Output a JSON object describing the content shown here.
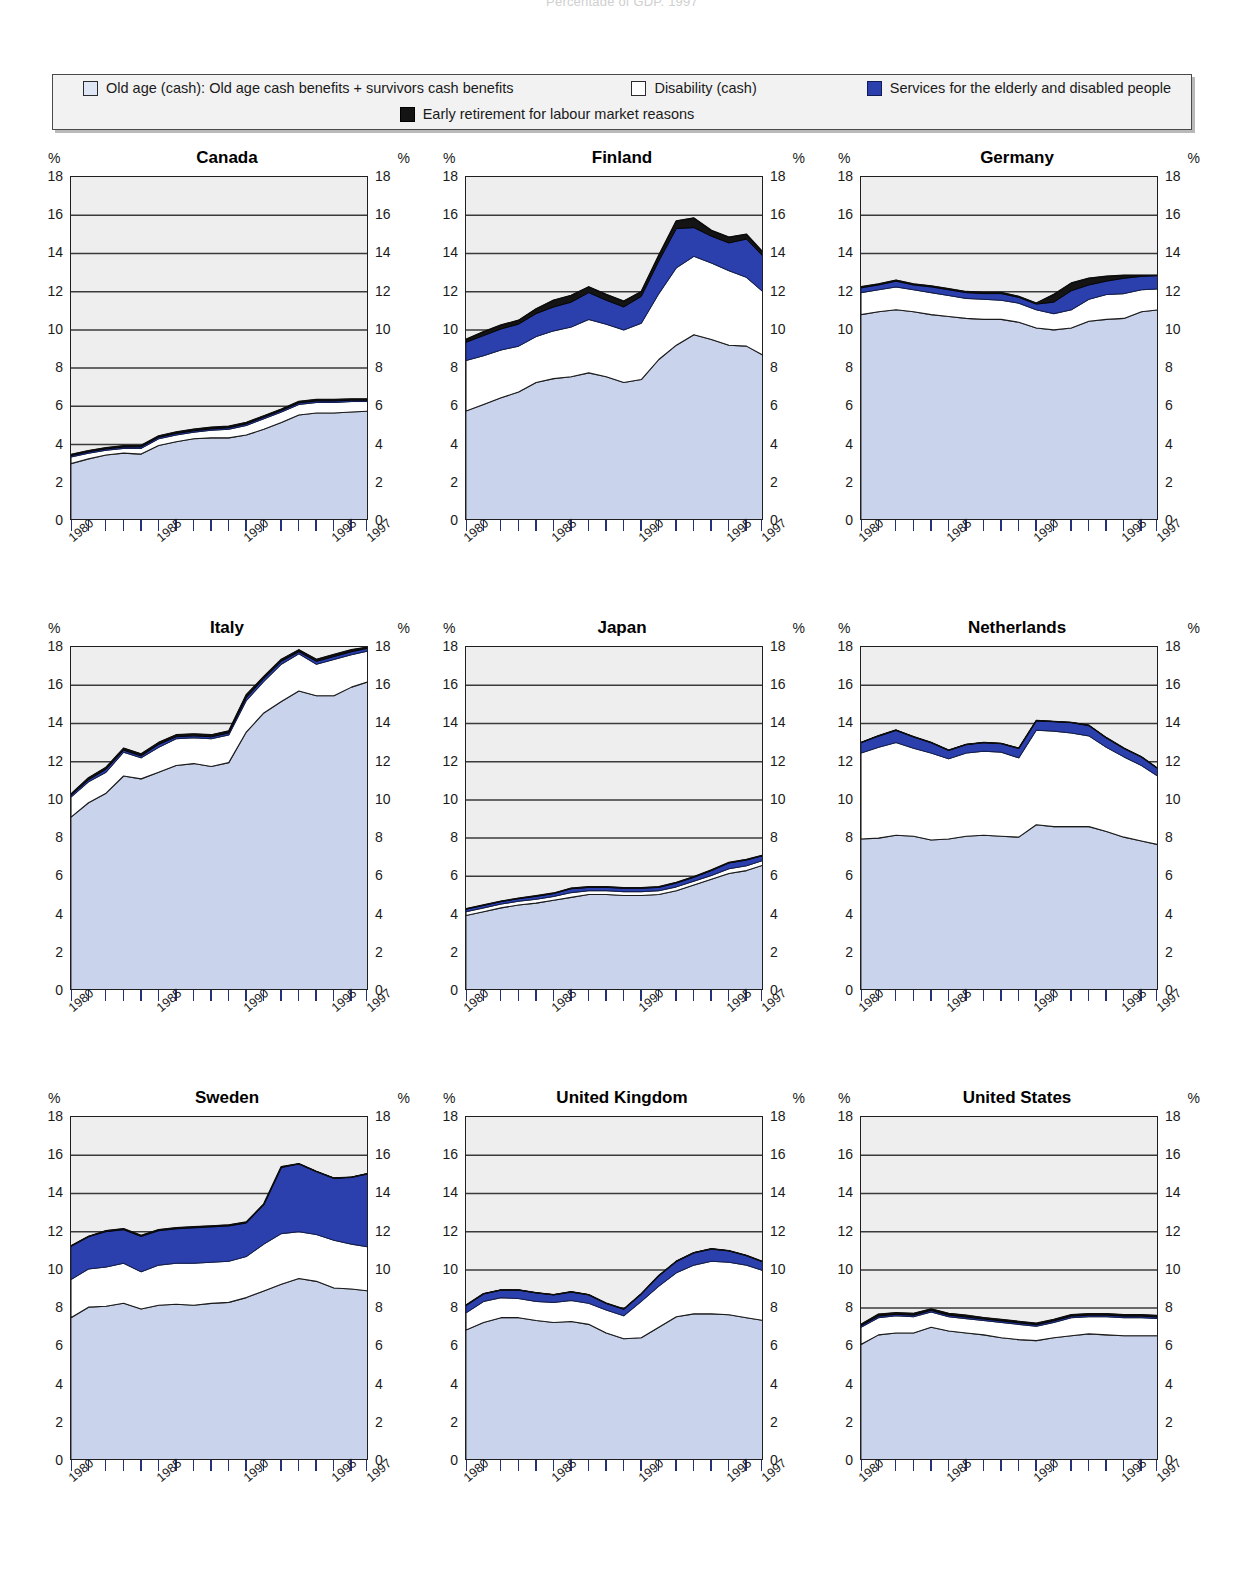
{
  "supertitle": "Percentage of GDP, 1997",
  "legend": {
    "items": [
      {
        "key": "old_age",
        "label": "Old age (cash): Old age cash benefits + survivors cash benefits",
        "color": "#dfe6f5",
        "swatch": "old-age-swatch"
      },
      {
        "key": "disability",
        "label": "Disability (cash)",
        "color": "#ffffff",
        "swatch": "disability-swatch"
      },
      {
        "key": "services",
        "label": "Services for the elderly and disabled people",
        "color": "#2b40ad",
        "swatch": "services-swatch"
      },
      {
        "key": "early_retirement",
        "label": "Early retirement for labour market reasons",
        "color": "#141414",
        "swatch": "early-retirement-swatch"
      }
    ]
  },
  "axis": {
    "unit": "%",
    "y_ticks": [
      0,
      2,
      4,
      6,
      8,
      10,
      12,
      14,
      16,
      18
    ],
    "ylim": [
      0,
      18
    ],
    "x_labels": [
      "1980",
      "1985",
      "1990",
      "1995",
      "1997"
    ],
    "x_label_years": [
      1980,
      1985,
      1990,
      1995,
      1997
    ],
    "xlim": [
      1980,
      1997
    ]
  },
  "colors": {
    "old_age": "#c9d4ec",
    "disability": "#ffffff",
    "services": "#2b40ad",
    "early_retirement": "#141414",
    "plot_background": "#eeeeee",
    "grid": "#3a3a3a",
    "frame": "#1f1f1f"
  },
  "chart_data": {
    "type": "area",
    "subtitle": "Percentage of GDP, 1997",
    "xlabel": "",
    "ylabel": "%",
    "ylim": [
      0,
      18
    ],
    "grid": true,
    "legend_position": "top",
    "stacked": true,
    "x": [
      1980,
      1981,
      1982,
      1983,
      1984,
      1985,
      1986,
      1987,
      1988,
      1989,
      1990,
      1991,
      1992,
      1993,
      1994,
      1995,
      1996,
      1997
    ],
    "series_order": [
      "old_age",
      "disability",
      "services",
      "early_retirement"
    ],
    "series_labels": {
      "old_age": "Old age (cash): Old age cash benefits + survivors cash benefits",
      "disability": "Disability (cash)",
      "services": "Services for the elderly and disabled people",
      "early_retirement": "Early retirement for labour market reasons"
    },
    "panels": [
      {
        "country": "Canada",
        "cum_old_age": [
          3.0,
          3.25,
          3.45,
          3.55,
          3.5,
          3.95,
          4.15,
          4.3,
          4.35,
          4.35,
          4.5,
          4.8,
          5.15,
          5.55,
          5.65,
          5.65,
          5.7,
          5.75
        ],
        "cum_disability": [
          3.35,
          3.55,
          3.7,
          3.8,
          3.8,
          4.3,
          4.5,
          4.65,
          4.75,
          4.8,
          5.0,
          5.35,
          5.7,
          6.1,
          6.2,
          6.2,
          6.25,
          6.25
        ],
        "cum_services": [
          3.42,
          3.62,
          3.77,
          3.87,
          3.88,
          4.38,
          4.58,
          4.72,
          4.82,
          4.88,
          5.08,
          5.43,
          5.78,
          6.18,
          6.28,
          6.28,
          6.32,
          6.32
        ],
        "cum_total": [
          3.48,
          3.68,
          3.83,
          3.93,
          3.95,
          4.45,
          4.65,
          4.8,
          4.9,
          4.95,
          5.15,
          5.5,
          5.85,
          6.25,
          6.35,
          6.35,
          6.38,
          6.38
        ]
      },
      {
        "country": "Finland",
        "cum_old_age": [
          5.75,
          6.1,
          6.45,
          6.75,
          7.25,
          7.45,
          7.55,
          7.75,
          7.55,
          7.25,
          7.4,
          8.45,
          9.2,
          9.75,
          9.5,
          9.2,
          9.15,
          8.65
        ],
        "cum_disability": [
          8.4,
          8.65,
          8.95,
          9.15,
          9.65,
          9.95,
          10.15,
          10.55,
          10.3,
          10.0,
          10.35,
          11.9,
          13.25,
          13.85,
          13.5,
          13.1,
          12.75,
          11.95
        ],
        "cum_services": [
          9.35,
          9.7,
          10.05,
          10.3,
          10.85,
          11.2,
          11.45,
          11.95,
          11.55,
          11.2,
          11.75,
          13.6,
          15.3,
          15.35,
          14.9,
          14.55,
          14.75,
          13.8
        ],
        "cum_total": [
          9.5,
          9.9,
          10.25,
          10.5,
          11.1,
          11.55,
          11.8,
          12.25,
          11.85,
          11.5,
          12.0,
          13.9,
          15.7,
          15.85,
          15.2,
          14.85,
          15.0,
          14.0
        ]
      },
      {
        "country": "Germany",
        "cum_old_age": [
          10.8,
          10.95,
          11.05,
          10.95,
          10.8,
          10.7,
          10.6,
          10.55,
          10.55,
          10.4,
          10.1,
          10.0,
          10.1,
          10.45,
          10.55,
          10.6,
          10.95,
          11.05
        ],
        "cum_disability": [
          11.95,
          12.1,
          12.25,
          12.1,
          11.95,
          11.8,
          11.65,
          11.6,
          11.55,
          11.4,
          11.05,
          10.85,
          11.05,
          11.6,
          11.85,
          11.9,
          12.1,
          12.15
        ],
        "cum_services": [
          12.2,
          12.35,
          12.55,
          12.35,
          12.25,
          12.1,
          11.95,
          11.9,
          11.9,
          11.7,
          11.35,
          11.45,
          12.05,
          12.35,
          12.55,
          12.7,
          12.8,
          12.85
        ],
        "cum_total": [
          12.25,
          12.4,
          12.6,
          12.4,
          12.3,
          12.15,
          12.0,
          11.95,
          11.95,
          11.75,
          11.4,
          11.85,
          12.45,
          12.7,
          12.8,
          12.85,
          12.85,
          12.85
        ]
      },
      {
        "country": "Italy",
        "cum_old_age": [
          9.1,
          9.85,
          10.35,
          11.25,
          11.1,
          11.45,
          11.8,
          11.9,
          11.75,
          11.95,
          13.55,
          14.55,
          15.15,
          15.7,
          15.45,
          15.45,
          15.9,
          16.2
        ],
        "cum_disability": [
          10.15,
          10.95,
          11.45,
          12.5,
          12.2,
          12.75,
          13.2,
          13.25,
          13.2,
          13.4,
          15.2,
          16.2,
          17.1,
          17.65,
          17.1,
          17.35,
          17.6,
          17.8
        ],
        "cum_services": [
          10.25,
          11.05,
          11.6,
          12.6,
          12.3,
          12.9,
          13.3,
          13.35,
          13.3,
          13.5,
          15.35,
          16.35,
          17.25,
          17.75,
          17.25,
          17.5,
          17.75,
          17.95
        ],
        "cum_total": [
          10.3,
          11.15,
          11.7,
          12.7,
          12.4,
          13.0,
          13.4,
          13.45,
          13.4,
          13.6,
          15.5,
          16.45,
          17.35,
          17.85,
          17.35,
          17.6,
          17.85,
          18.0
        ]
      },
      {
        "country": "Japan",
        "cum_old_age": [
          3.95,
          4.15,
          4.35,
          4.5,
          4.6,
          4.75,
          4.9,
          5.05,
          5.05,
          5.0,
          5.0,
          5.05,
          5.25,
          5.55,
          5.85,
          6.15,
          6.3,
          6.6
        ],
        "cum_disability": [
          4.15,
          4.35,
          4.55,
          4.7,
          4.8,
          4.95,
          5.15,
          5.25,
          5.25,
          5.2,
          5.2,
          5.25,
          5.45,
          5.75,
          6.05,
          6.4,
          6.55,
          6.85
        ],
        "cum_services": [
          4.28,
          4.48,
          4.68,
          4.83,
          4.95,
          5.1,
          5.35,
          5.42,
          5.42,
          5.38,
          5.38,
          5.42,
          5.65,
          5.95,
          6.3,
          6.7,
          6.85,
          7.1
        ],
        "cum_total": [
          4.3,
          4.5,
          4.7,
          4.85,
          4.98,
          5.12,
          5.38,
          5.45,
          5.45,
          5.4,
          5.4,
          5.45,
          5.68,
          5.98,
          6.33,
          6.72,
          6.88,
          7.12
        ]
      },
      {
        "country": "Netherlands",
        "cum_old_age": [
          7.95,
          8.0,
          8.15,
          8.1,
          7.9,
          7.95,
          8.1,
          8.15,
          8.1,
          8.05,
          8.7,
          8.6,
          8.6,
          8.6,
          8.35,
          8.05,
          7.85,
          7.65
        ],
        "cum_disability": [
          12.45,
          12.75,
          13.0,
          12.7,
          12.45,
          12.15,
          12.45,
          12.55,
          12.5,
          12.2,
          13.65,
          13.6,
          13.5,
          13.35,
          12.75,
          12.25,
          11.8,
          11.2
        ],
        "cum_services": [
          13.0,
          13.35,
          13.65,
          13.3,
          13.0,
          12.6,
          12.9,
          13.0,
          12.95,
          12.7,
          14.15,
          14.1,
          14.05,
          13.9,
          13.25,
          12.7,
          12.25,
          11.6
        ],
        "cum_total": [
          13.0,
          13.35,
          13.65,
          13.3,
          13.0,
          12.6,
          12.9,
          13.0,
          12.95,
          12.7,
          14.15,
          14.1,
          14.05,
          13.9,
          13.25,
          12.7,
          12.25,
          11.6
        ]
      },
      {
        "country": "Sweden",
        "cum_old_age": [
          7.5,
          8.05,
          8.1,
          8.25,
          7.95,
          8.15,
          8.2,
          8.15,
          8.25,
          8.3,
          8.55,
          8.9,
          9.25,
          9.55,
          9.4,
          9.05,
          9.0,
          8.9
        ],
        "cum_disability": [
          9.5,
          10.05,
          10.15,
          10.35,
          9.9,
          10.25,
          10.35,
          10.35,
          10.4,
          10.45,
          10.7,
          11.35,
          11.9,
          12.0,
          11.85,
          11.55,
          11.35,
          11.2
        ],
        "cum_services": [
          11.25,
          11.75,
          12.0,
          12.1,
          11.75,
          12.05,
          12.15,
          12.2,
          12.25,
          12.3,
          12.45,
          13.4,
          15.35,
          15.55,
          15.15,
          14.8,
          14.85,
          15.05
        ],
        "cum_total": [
          11.25,
          11.75,
          12.05,
          12.15,
          11.8,
          12.1,
          12.2,
          12.25,
          12.3,
          12.35,
          12.5,
          13.45,
          15.4,
          15.55,
          15.15,
          14.8,
          14.85,
          15.05
        ]
      },
      {
        "country": "United Kingdom",
        "cum_old_age": [
          6.85,
          7.25,
          7.5,
          7.5,
          7.35,
          7.25,
          7.3,
          7.15,
          6.7,
          6.4,
          6.45,
          7.0,
          7.55,
          7.7,
          7.7,
          7.65,
          7.5,
          7.35
        ],
        "cum_disability": [
          7.75,
          8.35,
          8.55,
          8.5,
          8.35,
          8.3,
          8.4,
          8.25,
          7.9,
          7.6,
          8.35,
          9.15,
          9.85,
          10.25,
          10.45,
          10.4,
          10.25,
          9.95
        ],
        "cum_services": [
          8.15,
          8.75,
          8.95,
          8.95,
          8.8,
          8.7,
          8.85,
          8.7,
          8.25,
          7.95,
          8.75,
          9.7,
          10.45,
          10.9,
          11.1,
          11.0,
          10.75,
          10.4
        ],
        "cum_total": [
          8.15,
          8.75,
          8.95,
          8.95,
          8.8,
          8.7,
          8.85,
          8.7,
          8.25,
          7.95,
          8.75,
          9.7,
          10.45,
          10.9,
          11.1,
          11.0,
          10.75,
          10.4
        ]
      },
      {
        "country": "United States",
        "cum_old_age": [
          6.1,
          6.6,
          6.7,
          6.7,
          7.0,
          6.8,
          6.7,
          6.6,
          6.45,
          6.35,
          6.3,
          6.45,
          6.55,
          6.65,
          6.6,
          6.55,
          6.55,
          6.55
        ],
        "cum_disability": [
          7.0,
          7.5,
          7.6,
          7.55,
          7.8,
          7.55,
          7.45,
          7.35,
          7.25,
          7.15,
          7.05,
          7.25,
          7.5,
          7.55,
          7.55,
          7.5,
          7.5,
          7.45
        ],
        "cum_services": [
          7.08,
          7.58,
          7.68,
          7.63,
          7.88,
          7.63,
          7.53,
          7.43,
          7.33,
          7.23,
          7.13,
          7.33,
          7.58,
          7.63,
          7.63,
          7.58,
          7.58,
          7.53
        ],
        "cum_total": [
          7.15,
          7.68,
          7.75,
          7.72,
          7.95,
          7.72,
          7.62,
          7.5,
          7.4,
          7.3,
          7.2,
          7.4,
          7.65,
          7.7,
          7.7,
          7.65,
          7.65,
          7.6
        ]
      }
    ]
  }
}
